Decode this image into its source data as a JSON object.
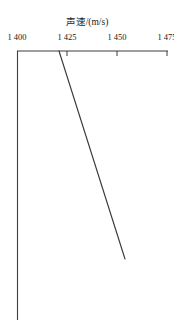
{
  "chart_data": {
    "type": "line",
    "title": "声速/(m/s)",
    "xlabel": "声速/(m/s)",
    "ylabel": "",
    "axis_position": "top",
    "grid": false,
    "legend": null,
    "xlim": [
      1400,
      1475
    ],
    "ylim": [
      0,
      1
    ],
    "xticks": [
      1400,
      1425,
      1450,
      1475
    ],
    "xtick_labels": [
      "1 400",
      "1 425",
      "1 450",
      "1 475"
    ],
    "yticks": [],
    "ytick_labels": [],
    "y_axis_direction": "downward (depth increases downward)",
    "series": [
      {
        "name": "sound-speed-profile",
        "color": "#3a3a3a",
        "x": [
          1421,
          1454
        ],
        "y": [
          0.0,
          1.0
        ],
        "description": "straight line from top near 1 421 m/s descending right to about 1 454 m/s"
      }
    ]
  },
  "geometry": {
    "axis_y_px": 51,
    "axis_x_left_px": 17,
    "axis_x_right_px": 168,
    "y_axis_bottom_px": 320,
    "tick_px": [
      17,
      67,
      117,
      167
    ],
    "line_start_px": [
      59,
      51
    ],
    "line_end_px": [
      126,
      259
    ]
  },
  "colors": {
    "background": "#ffffff",
    "axis": "#3d3d3d",
    "curve": "#3a3a3a",
    "text": "#1a1a1a"
  }
}
